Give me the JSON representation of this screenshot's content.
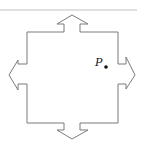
{
  "diagram": {
    "point_label": "P",
    "arrows": [
      "up",
      "right",
      "down",
      "left"
    ],
    "colors": {
      "outline": "#7a7a7a",
      "divider": "#d6d6d6",
      "point": "#111111"
    }
  }
}
